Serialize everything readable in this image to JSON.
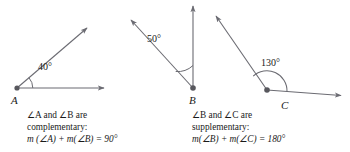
{
  "figure": {
    "background_color": "#ffffff",
    "line_color": "#6b6b72",
    "text_color": "#1a1a1a",
    "width": 350,
    "height": 152
  },
  "diagrams": [
    {
      "id": "angle-a",
      "vertex_label": "A",
      "angle_value": "40°",
      "vertex": {
        "x": 17,
        "y": 88
      },
      "rays": [
        {
          "name": "ray-a-horizontal",
          "x2": 108,
          "y2": 88
        },
        {
          "name": "ray-a-diagonal",
          "x2": 90,
          "y2": 25
        }
      ],
      "arc_radius": 15
    },
    {
      "id": "angle-b",
      "vertex_label": "B",
      "angle_value": "50°",
      "vertex": {
        "x": 193,
        "y": 88
      },
      "rays": [
        {
          "name": "ray-b-vertical",
          "x2": 193,
          "y2": 4
        },
        {
          "name": "ray-b-diagonal",
          "x2": 129,
          "y2": 18
        }
      ],
      "arc_radius": 22
    },
    {
      "id": "angle-c",
      "vertex_label": "C",
      "angle_value": "130°",
      "vertex": {
        "x": 267,
        "y": 90
      },
      "rays": [
        {
          "name": "ray-c-horizontal",
          "x2": 345,
          "y2": 96
        },
        {
          "name": "ray-c-diagonal",
          "x2": 214,
          "y2": 14
        }
      ],
      "arc_radius": 20
    }
  ],
  "captions": {
    "left": {
      "line1": "∠A and ∠B are",
      "line2": "complementary:",
      "line3": "m (∠A) + m(∠B) = 90°"
    },
    "right": {
      "line1": "∠B and ∠C are",
      "line2": "supplementary:",
      "line3": "m(∠B) + m(∠C) = 180°"
    }
  },
  "labels": {
    "vertex_a": "A",
    "vertex_b": "B",
    "vertex_c": "C",
    "angle_a": "40°",
    "angle_b": "50°",
    "angle_c": "130°"
  }
}
